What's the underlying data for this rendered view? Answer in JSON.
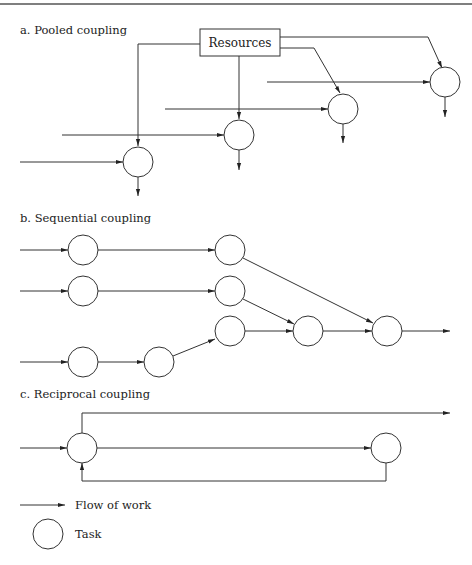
{
  "figure": {
    "sections": [
      {
        "id": "pooled",
        "title": "a. Pooled coupling",
        "resource_box_label": "Resources"
      },
      {
        "id": "sequential",
        "title": "b. Sequential coupling"
      },
      {
        "id": "reciprocal",
        "title": "c. Reciprocal coupling"
      }
    ],
    "legend": {
      "flow_label": "Flow of work",
      "task_label": "Task"
    },
    "colors": {
      "line": "#333333",
      "background": "#ffffff"
    }
  }
}
